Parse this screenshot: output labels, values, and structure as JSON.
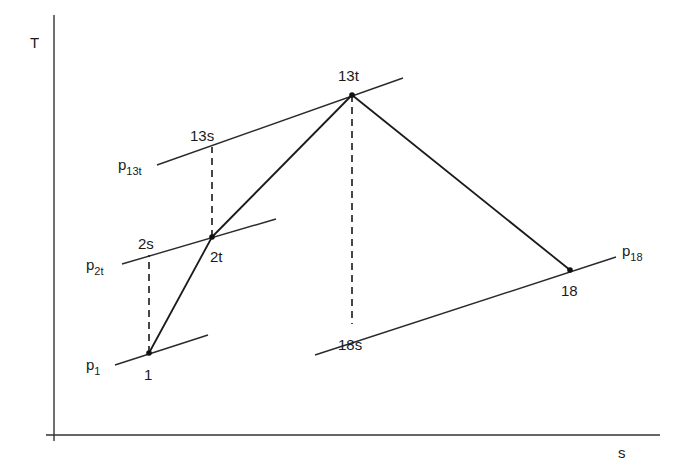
{
  "diagram": {
    "type": "T-s diagram",
    "axes": {
      "y_label": "T",
      "x_label": "s"
    },
    "isobars": [
      {
        "id": "p1",
        "base": "p",
        "sub": "1",
        "x1": 115,
        "y1": 365,
        "x2": 208,
        "y2": 335,
        "label_x": 86,
        "label_y": 370
      },
      {
        "id": "p2t",
        "base": "p",
        "sub": "2t",
        "x1": 122,
        "y1": 264,
        "x2": 276,
        "y2": 219,
        "label_x": 86,
        "label_y": 270
      },
      {
        "id": "p13t",
        "base": "p",
        "sub": "13t",
        "x1": 157,
        "y1": 165,
        "x2": 403,
        "y2": 78,
        "label_x": 118,
        "label_y": 170
      },
      {
        "id": "p18",
        "base": "p",
        "sub": "18",
        "x1": 315,
        "y1": 355,
        "x2": 616,
        "y2": 257,
        "label_x": 622,
        "label_y": 256
      }
    ],
    "points": [
      {
        "id": "1",
        "label": "1",
        "x": 149,
        "y": 353,
        "dot": true,
        "label_x": 144,
        "label_y": 380
      },
      {
        "id": "2s",
        "label": "2s",
        "x": 149,
        "y": 255,
        "dot": false,
        "label_x": 138,
        "label_y": 249
      },
      {
        "id": "2t",
        "label": "2t",
        "x": 212,
        "y": 237,
        "dot": true,
        "label_x": 210,
        "label_y": 262
      },
      {
        "id": "13s",
        "label": "13s",
        "x": 212,
        "y": 147,
        "dot": false,
        "label_x": 190,
        "label_y": 141
      },
      {
        "id": "13t",
        "label": "13t",
        "x": 352,
        "y": 95,
        "dot": true,
        "label_x": 338,
        "label_y": 81
      },
      {
        "id": "18",
        "label": "18",
        "x": 570,
        "y": 270,
        "dot": true,
        "label_x": 561,
        "label_y": 296
      },
      {
        "id": "18s",
        "label": "18s",
        "x": 352,
        "y": 324,
        "dot": false,
        "label_x": 338,
        "label_y": 350
      }
    ],
    "process_lines": [
      {
        "from": "1",
        "to": "2t"
      },
      {
        "from": "2t",
        "to": "13t"
      },
      {
        "from": "13t",
        "to": "18"
      }
    ],
    "isentropic_lines": [
      {
        "from": "1",
        "to": "2s"
      },
      {
        "from": "2t",
        "to": "13s"
      },
      {
        "from": "13t",
        "to": "18s"
      }
    ]
  }
}
